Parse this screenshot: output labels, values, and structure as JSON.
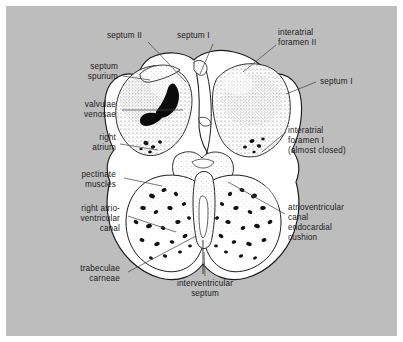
{
  "figure": {
    "background_color": "#bdbdbd",
    "panel_color": "#bdbdbd",
    "page_color": "#ffffff",
    "ink_color": "#1b1b1b",
    "tissue_fill": "#ffffff",
    "leader_color": "#4a4a4a"
  },
  "labels": {
    "septum_ii": "septum II",
    "septum_i_top": "septum I",
    "interatrial_foramen_ii_l1": "interatrial",
    "interatrial_foramen_ii_l2": "foramen II",
    "septum_spurium_l1": "septum",
    "septum_spurium_l2": "spurium",
    "septum_i_right": "septum I",
    "valvulae_venosae_l1": "valvulae",
    "valvulae_venosae_l2": "venosae",
    "right_atrium_l1": "right",
    "right_atrium_l2": "atrium",
    "interatrial_foramen_i_l1": "interatrial",
    "interatrial_foramen_i_l2": "foramen I",
    "interatrial_foramen_i_l3": "(almost closed)",
    "pectinate_muscles_l1": "pectinate",
    "pectinate_muscles_l2": "muscles",
    "right_av_canal_l1": "right atrio-",
    "right_av_canal_l2": "ventricular",
    "right_av_canal_l3": "canal",
    "av_cushion_l1": "atrioventricular",
    "av_cushion_l2": "canal",
    "av_cushion_l3": "endocardial",
    "av_cushion_l4": "cushion",
    "trabeculae_carneae_l1": "trabeculae",
    "trabeculae_carneae_l2": "carneae",
    "interventricular_septum_l1": "interventricular",
    "interventricular_septum_l2": "septum"
  }
}
